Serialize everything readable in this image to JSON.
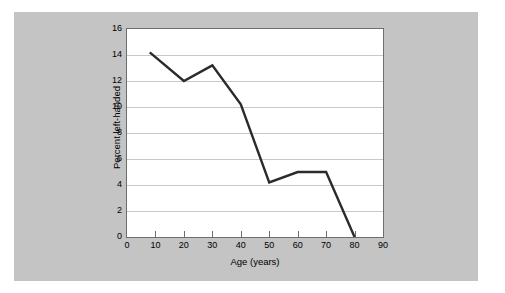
{
  "figure": {
    "background_color": "#ffffff",
    "panel_color": "#c4c4c4",
    "plot_background": "#ffffff",
    "frame_color": "#6e6e6e",
    "gridline_color": "#c8c8c8",
    "series_color": "#2b2b2b"
  },
  "chart_data": {
    "type": "line",
    "title": "",
    "xlabel": "Age (years)",
    "ylabel": "Percent left-handed",
    "xlim": [
      0,
      90
    ],
    "ylim": [
      0,
      16
    ],
    "xticks": [
      0,
      10,
      20,
      30,
      40,
      50,
      60,
      70,
      80,
      90
    ],
    "xtick_labels": [
      "0",
      "10",
      "20",
      "30",
      "40",
      "50",
      "60",
      "70",
      "80",
      "90"
    ],
    "yticks": [
      0,
      2,
      4,
      6,
      8,
      10,
      12,
      14,
      16
    ],
    "ytick_labels": [
      "0",
      "2",
      "4",
      "6",
      "8",
      "10",
      "12",
      "14",
      "16"
    ],
    "grid": "horizontal",
    "legend": "none",
    "x": [
      8,
      20,
      30,
      40,
      50,
      60,
      70,
      80
    ],
    "y": [
      14.2,
      12.0,
      13.2,
      10.2,
      4.2,
      5.0,
      5.0,
      0.0
    ],
    "series": [
      {
        "name": "Percent left-handed",
        "color": "#2b2b2b",
        "line_width": 2.4,
        "points": [
          {
            "x": 8,
            "y": 14.2
          },
          {
            "x": 20,
            "y": 12.0
          },
          {
            "x": 30,
            "y": 13.2
          },
          {
            "x": 40,
            "y": 10.2
          },
          {
            "x": 50,
            "y": 4.2
          },
          {
            "x": 60,
            "y": 5.0
          },
          {
            "x": 70,
            "y": 5.0
          },
          {
            "x": 80,
            "y": 0.0
          }
        ]
      }
    ]
  }
}
